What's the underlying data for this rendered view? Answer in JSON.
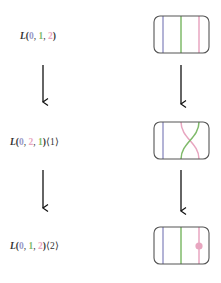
{
  "colors": {
    "blue": "#9a9ac8",
    "green": "#7fba6a",
    "pink": "#e8a6c0",
    "arrow": "#111111",
    "box": "#555555"
  },
  "rows": [
    {
      "label": {
        "prefix": "L(",
        "n0": "0",
        "sep1": ", ",
        "n1": "1",
        "sep2": ", ",
        "n2": "2",
        "suffix": ")",
        "shift": ""
      },
      "box": "identity"
    },
    {
      "label": {
        "prefix": "L(",
        "n0": "0",
        "sep1": ", ",
        "n1": "2",
        "sep2": ", ",
        "n2": "1",
        "suffix": ")",
        "shift": "⟨1⟩"
      },
      "box": "crossing"
    },
    {
      "label": {
        "prefix": "L(",
        "n0": "0",
        "sep1": ", ",
        "n1": "1",
        "sep2": ", ",
        "n2": "2",
        "suffix": ")",
        "shift": "⟨2⟩"
      },
      "box": "dot"
    }
  ]
}
